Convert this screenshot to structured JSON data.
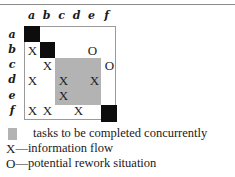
{
  "diagram": {
    "type": "design-structure-matrix",
    "column_labels": [
      "a",
      "b",
      "c",
      "d",
      "e",
      "f"
    ],
    "row_labels": [
      "a",
      "b",
      "c",
      "d",
      "e",
      "f"
    ],
    "diagonal": [
      "a",
      "b",
      "f"
    ],
    "concurrent_block": {
      "rows": [
        "c",
        "d",
        "e"
      ],
      "cols": [
        "c",
        "d",
        "e"
      ]
    },
    "marks": [
      {
        "row": "b",
        "col": "a",
        "symbol": "X"
      },
      {
        "row": "b",
        "col": "e",
        "symbol": "O"
      },
      {
        "row": "c",
        "col": "b",
        "symbol": "X"
      },
      {
        "row": "c",
        "col": "f",
        "symbol": "O"
      },
      {
        "row": "d",
        "col": "a",
        "symbol": "X"
      },
      {
        "row": "d",
        "col": "c",
        "symbol": "X"
      },
      {
        "row": "d",
        "col": "e",
        "symbol": "X"
      },
      {
        "row": "e",
        "col": "c",
        "symbol": "X"
      },
      {
        "row": "f",
        "col": "a",
        "symbol": "X"
      },
      {
        "row": "f",
        "col": "b",
        "symbol": "X"
      },
      {
        "row": "f",
        "col": "d",
        "symbol": "X"
      }
    ],
    "colors": {
      "diagonal": "#0d0d0d",
      "concurrent": "#b3b3b3",
      "frame": "#9a9a9a"
    }
  },
  "legend": {
    "concurrent_label": "tasks to be completed concurrently",
    "x_symbol": "X",
    "x_label": "—information flow",
    "o_symbol": "O",
    "o_label": "—potential rework situation"
  }
}
